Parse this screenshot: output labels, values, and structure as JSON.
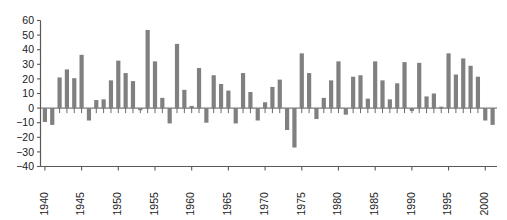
{
  "chart_data": {
    "type": "bar",
    "title": "",
    "subtitle": "",
    "xlabel": "",
    "ylabel": "",
    "grid": false,
    "legend": null,
    "orientation": "vertical",
    "bar_color": "#808080",
    "axis_color": "#595959",
    "ylim": [
      -40,
      60
    ],
    "ytick_labels": [
      "60",
      "50",
      "40",
      "30",
      "20",
      "10",
      "0",
      "−10",
      "−20",
      "−30",
      "−40"
    ],
    "yticks": [
      60,
      50,
      40,
      30,
      20,
      10,
      0,
      -10,
      -20,
      -30,
      -40
    ],
    "xlim": [
      1939.4,
      2001.6
    ],
    "xtick_labels": [
      "1940",
      "1945",
      "1950",
      "1955",
      "1960",
      "1965",
      "1970",
      "1975",
      "1980",
      "1985",
      "1990",
      "1995",
      "2000"
    ],
    "xticks": [
      1940,
      1945,
      1950,
      1955,
      1960,
      1965,
      1970,
      1975,
      1980,
      1985,
      1990,
      1995,
      2000
    ],
    "xtick_rotation": 90,
    "categories": [
      1940,
      1941,
      1942,
      1943,
      1944,
      1945,
      1946,
      1947,
      1948,
      1949,
      1950,
      1951,
      1952,
      1953,
      1954,
      1955,
      1956,
      1957,
      1958,
      1959,
      1960,
      1961,
      1962,
      1963,
      1964,
      1965,
      1966,
      1967,
      1968,
      1969,
      1970,
      1971,
      1972,
      1973,
      1974,
      1975,
      1976,
      1977,
      1978,
      1979,
      1980,
      1981,
      1982,
      1983,
      1984,
      1985,
      1986,
      1987,
      1988,
      1989,
      1990,
      1991,
      1992,
      1993,
      1994,
      1995,
      1996,
      1997,
      1998,
      1999,
      2000,
      2001
    ],
    "values": [
      -9.5,
      -11.5,
      21.0,
      26.5,
      20.5,
      36.5,
      -8.5,
      5.5,
      6.0,
      19.0,
      32.5,
      24.0,
      18.5,
      -1.5,
      53.5,
      32.0,
      7.0,
      -10.5,
      44.0,
      12.5,
      1.5,
      27.5,
      -10.0,
      22.5,
      16.5,
      12.0,
      -10.5,
      24.0,
      11.0,
      -8.5,
      4.0,
      14.5,
      19.5,
      -15.0,
      -27.0,
      37.5,
      24.0,
      -7.5,
      7.0,
      19.0,
      32.0,
      -4.5,
      21.5,
      22.5,
      6.5,
      32.0,
      19.0,
      6.0,
      17.0,
      31.5,
      -2.0,
      31.0,
      8.0,
      10.0,
      1.0,
      37.5,
      23.0,
      34.0,
      29.0,
      21.5,
      -8.5,
      -11.5
    ]
  }
}
